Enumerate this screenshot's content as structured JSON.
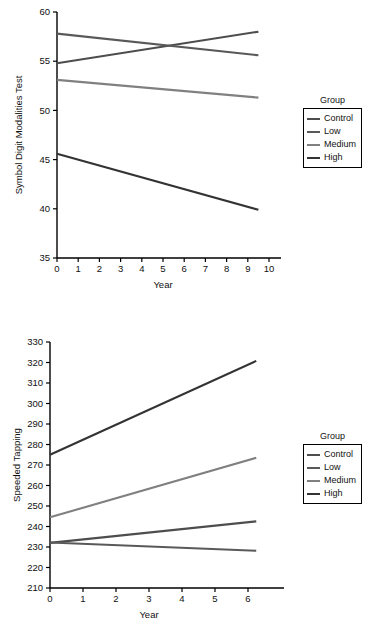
{
  "figure": {
    "panels": [
      "symbol-digit-modalities-test",
      "speeded-tapping"
    ]
  },
  "legend": {
    "title": "Group",
    "entries": [
      {
        "label": "Control",
        "color": "#4d4d4d"
      },
      {
        "label": "Low",
        "color": "#595959"
      },
      {
        "label": "Medium",
        "color": "#808080"
      },
      {
        "label": "High",
        "color": "#333333"
      }
    ]
  },
  "chart_data": [
    {
      "type": "line",
      "title": "",
      "xlabel": "Year",
      "ylabel": "Symbol Digit Modalities Test",
      "xlim": [
        0,
        10
      ],
      "ylim": [
        35,
        60
      ],
      "xticks": [
        0,
        1,
        2,
        3,
        4,
        5,
        6,
        7,
        8,
        9,
        10
      ],
      "yticks": [
        35,
        40,
        45,
        50,
        55,
        60
      ],
      "grid": false,
      "legend_position": "right",
      "x": [
        0,
        9.5
      ],
      "series": [
        {
          "name": "Control",
          "values": [
            54.8,
            58.0
          ],
          "color": "#4d4d4d"
        },
        {
          "name": "Low",
          "values": [
            57.8,
            55.6
          ],
          "color": "#595959"
        },
        {
          "name": "Medium",
          "values": [
            53.1,
            51.3
          ],
          "color": "#808080"
        },
        {
          "name": "High",
          "values": [
            45.6,
            39.9
          ],
          "color": "#333333"
        }
      ]
    },
    {
      "type": "line",
      "title": "",
      "xlabel": "Year",
      "ylabel": "Speeded Tapping",
      "xlim": [
        0,
        6
      ],
      "ylim": [
        210,
        330
      ],
      "xticks": [
        0,
        1,
        2,
        3,
        4,
        5,
        6
      ],
      "yticks": [
        210,
        220,
        230,
        240,
        250,
        260,
        270,
        280,
        290,
        300,
        310,
        320,
        330
      ],
      "grid": false,
      "legend_position": "right",
      "x": [
        0,
        6.25
      ],
      "series": [
        {
          "name": "Control",
          "values": [
            232.0,
            242.5
          ],
          "color": "#4d4d4d"
        },
        {
          "name": "Low",
          "values": [
            232.2,
            228.2
          ],
          "color": "#595959"
        },
        {
          "name": "Medium",
          "values": [
            244.5,
            273.5
          ],
          "color": "#808080"
        },
        {
          "name": "High",
          "values": [
            275.0,
            320.8
          ],
          "color": "#333333"
        }
      ]
    }
  ]
}
